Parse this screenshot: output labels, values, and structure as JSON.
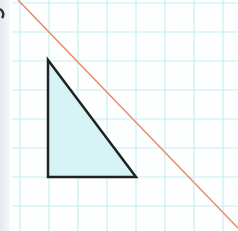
{
  "figure": {
    "grid": {
      "spacing": 29,
      "origin_x": 20,
      "origin_y": 3,
      "color": "#c9eef0"
    },
    "triangle": {
      "points": [
        [
          48,
          60
        ],
        [
          48,
          177
        ],
        [
          136,
          177
        ]
      ],
      "fill": "#d6f3f6",
      "stroke": "#222222"
    },
    "line": {
      "from": [
        18,
        0
      ],
      "to": [
        238,
        228
      ],
      "color": "#e8896a"
    },
    "partial_mark": {
      "color": "#333333"
    }
  }
}
